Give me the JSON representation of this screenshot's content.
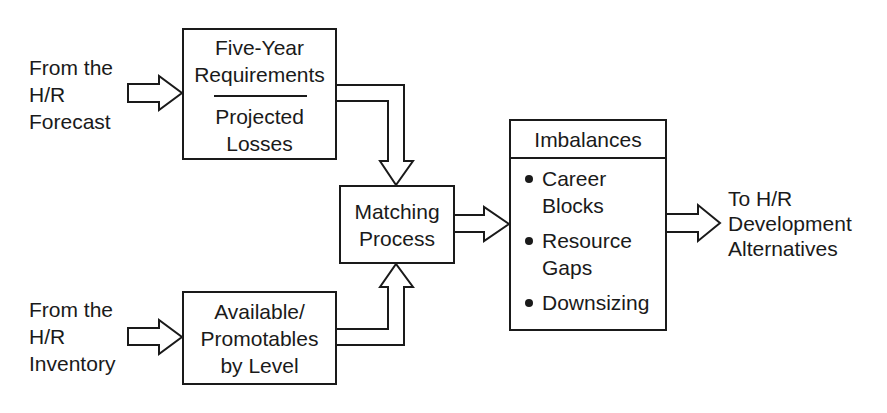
{
  "diagram": {
    "inputs": {
      "forecast": {
        "lines": [
          "From the",
          "H/R",
          "Forecast"
        ]
      },
      "inventory": {
        "lines": [
          "From the",
          "H/R",
          "Inventory"
        ]
      }
    },
    "boxes": {
      "requirements": {
        "top_lines": [
          "Five-Year",
          "Requirements"
        ],
        "bottom_lines": [
          "Projected",
          "Losses"
        ]
      },
      "available": {
        "lines": [
          "Available/",
          "Promotables",
          "by Level"
        ]
      },
      "matching": {
        "lines": [
          "Matching",
          "Process"
        ]
      },
      "imbalances": {
        "header": "Imbalances",
        "items": [
          {
            "lines": [
              "Career",
              "Blocks"
            ]
          },
          {
            "lines": [
              "Resource",
              "Gaps"
            ]
          },
          {
            "lines": [
              "Downsizing"
            ]
          }
        ]
      }
    },
    "output": {
      "lines": [
        "To H/R",
        "Development",
        "Alternatives"
      ]
    },
    "colors": {
      "stroke": "#1a1a1a",
      "background": "#ffffff"
    }
  }
}
